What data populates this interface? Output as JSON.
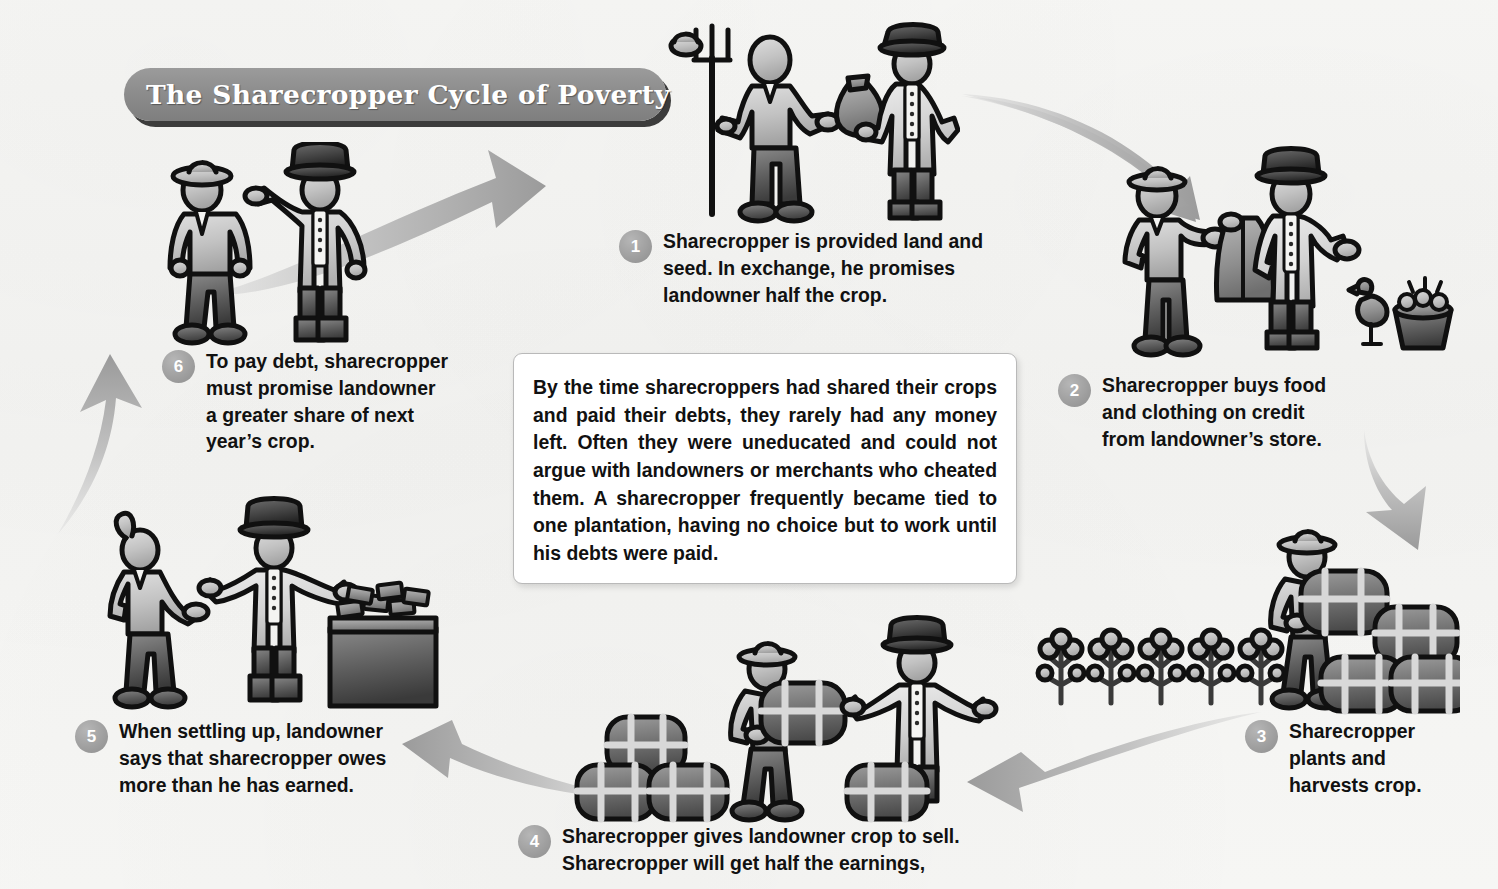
{
  "title": {
    "text": "The Sharecropper Cycle of Poverty"
  },
  "center_callout": {
    "text": "By the time sharecroppers had shared their crops and paid their debts, they rarely had any money left. Often they were uneducated and could not argue with landowners or merchants who cheated them. A sharecropper frequently became tied to one plantation, having no choice but to work until his debts were paid."
  },
  "steps": [
    {
      "number": "1",
      "text": "Sharecropper is provided land and\nseed. In exchange, he promises\nlandowner half the crop."
    },
    {
      "number": "2",
      "text": "Sharecropper buys food\nand clothing on credit\nfrom landowner’s store."
    },
    {
      "number": "3",
      "text": "Sharecropper\nplants and\nharvests crop."
    },
    {
      "number": "4",
      "text": "Sharecropper gives landowner crop to sell.\nSharecropper will get half the earnings,"
    },
    {
      "number": "5",
      "text": "When settling up, landowner\nsays that sharecropper owes\nmore than he has earned."
    },
    {
      "number": "6",
      "text": "To pay debt, sharecropper\nmust promise landowner\na greater share of next\nyear’s crop."
    }
  ],
  "scenes": [
    {
      "id": "scene1",
      "name": "sharecropper-receiving-seed-bag-from-landowner"
    },
    {
      "id": "scene2",
      "name": "sharecropper-receiving-coat-food-on-credit"
    },
    {
      "id": "scene3",
      "name": "sharecropper-harvesting-cotton-bales"
    },
    {
      "id": "scene4",
      "name": "sharecropper-delivering-cotton-bales-to-landowner"
    },
    {
      "id": "scene5",
      "name": "landowner-settling-accounts-at-money-table"
    },
    {
      "id": "scene6",
      "name": "landowner-pointing-demanding-greater-share"
    }
  ],
  "arrows": [
    {
      "id": "arrow-6-1",
      "from": "6",
      "to": "1"
    },
    {
      "id": "arrow-1-2",
      "from": "1",
      "to": "2"
    },
    {
      "id": "arrow-2-3",
      "from": "2",
      "to": "3"
    },
    {
      "id": "arrow-3-4",
      "from": "3",
      "to": "4"
    },
    {
      "id": "arrow-4-5",
      "from": "4",
      "to": "5"
    },
    {
      "id": "arrow-5-6",
      "from": "5",
      "to": "6"
    }
  ],
  "colors": {
    "background": "#f6f6f4",
    "banner_gray": "#8d8d8d",
    "badge_gray": "#9a9a9a",
    "arrow_gray": "#a8a8a8",
    "ink": "#111111",
    "figure_light": "#c9c9c9",
    "figure_mid": "#9a9a9a",
    "figure_dark": "#5f5f5f",
    "outline": "#101010"
  }
}
